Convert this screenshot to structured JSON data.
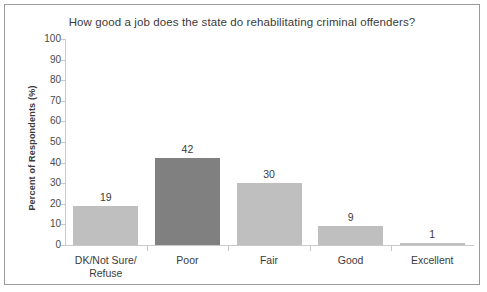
{
  "chart_data": {
    "type": "bar",
    "title": "How good a job does the state do rehabilitating criminal offenders?",
    "xlabel": "",
    "ylabel": "Percent of Respondents (%)",
    "ylim": [
      0,
      100
    ],
    "yticks": [
      100,
      90,
      80,
      70,
      60,
      50,
      40,
      30,
      20,
      10,
      0
    ],
    "ytick_labels": [
      "100",
      "90",
      "80",
      "70",
      "60",
      "50",
      "40",
      "30",
      "20",
      "10",
      "0"
    ],
    "grid": false,
    "legend": null,
    "categories": [
      "DK/Not Sure/\nRefuse",
      "Poor",
      "Fair",
      "Good",
      "Excellent"
    ],
    "values": [
      19,
      42,
      30,
      9,
      1
    ],
    "value_labels": [
      "19",
      "42",
      "30",
      "9",
      "1"
    ],
    "bar_colors": [
      "#bfbfbf",
      "#808080",
      "#bfbfbf",
      "#bfbfbf",
      "#bfbfbf"
    ],
    "colors": {
      "axis": "#c9c9c9",
      "frame_border": "#9a9a9a",
      "text": "#3b3b3b",
      "background": "#ffffff",
      "bar_light": "#bfbfbf",
      "bar_dark": "#808080"
    }
  }
}
